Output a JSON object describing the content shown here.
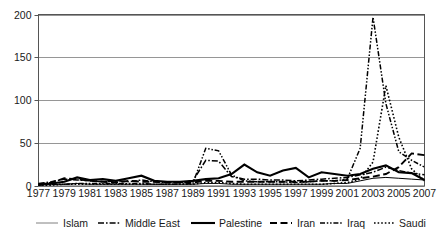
{
  "chart_data": {
    "type": "line",
    "title": "",
    "xlabel": "",
    "ylabel": "",
    "xlim": [
      1977,
      2007
    ],
    "ylim": [
      0,
      200
    ],
    "yticks": [
      0,
      50,
      100,
      150,
      200
    ],
    "ytick_labels": [
      "0",
      "50",
      "100",
      "150",
      "200"
    ],
    "grid": true,
    "legend_position": "bottom",
    "x": [
      1977,
      1978,
      1979,
      1980,
      1981,
      1982,
      1983,
      1984,
      1985,
      1986,
      1987,
      1988,
      1989,
      1990,
      1991,
      1992,
      1993,
      1994,
      1995,
      1996,
      1997,
      1998,
      1999,
      2000,
      2001,
      2002,
      2003,
      2004,
      2005,
      2006,
      2007
    ],
    "xtick_labels": [
      "1977",
      "1979",
      "1981",
      "1983",
      "1985",
      "1987",
      "1989",
      "1991",
      "1993",
      "1995",
      "1997",
      "1999",
      "2001",
      "2003",
      "2005",
      "2007"
    ],
    "series": [
      {
        "name": "Islam",
        "style": "thin-solid",
        "color": "#808080",
        "values": [
          1,
          2,
          2,
          3,
          2,
          2,
          2,
          2,
          2,
          2,
          2,
          2,
          2,
          3,
          3,
          2,
          2,
          2,
          2,
          2,
          2,
          2,
          2,
          3,
          3,
          6,
          9,
          10,
          9,
          8,
          7
        ]
      },
      {
        "name": "Middle East",
        "style": "dash-dot",
        "color": "#000000",
        "values": [
          3,
          5,
          8,
          7,
          6,
          5,
          6,
          5,
          7,
          5,
          4,
          4,
          6,
          30,
          29,
          11,
          8,
          8,
          7,
          7,
          6,
          7,
          8,
          9,
          10,
          13,
          16,
          22,
          18,
          15,
          13
        ]
      },
      {
        "name": "Palestine",
        "style": "thick-solid",
        "color": "#000000",
        "values": [
          2,
          3,
          5,
          10,
          7,
          8,
          6,
          9,
          12,
          6,
          5,
          5,
          6,
          8,
          9,
          14,
          25,
          16,
          12,
          18,
          21,
          10,
          16,
          14,
          12,
          14,
          20,
          24,
          16,
          15,
          7
        ]
      },
      {
        "name": "Iran",
        "style": "long-dash",
        "color": "#000000",
        "values": [
          2,
          4,
          9,
          8,
          6,
          5,
          4,
          6,
          5,
          5,
          4,
          4,
          4,
          6,
          6,
          5,
          5,
          5,
          5,
          5,
          5,
          5,
          6,
          6,
          7,
          9,
          11,
          14,
          22,
          38,
          36
        ]
      },
      {
        "name": "Iraq",
        "style": "dash-dot-dot",
        "color": "#000000",
        "values": [
          1,
          2,
          2,
          3,
          3,
          3,
          3,
          3,
          3,
          2,
          2,
          2,
          3,
          44,
          41,
          13,
          6,
          5,
          5,
          5,
          4,
          5,
          6,
          6,
          8,
          44,
          197,
          96,
          40,
          30,
          22
        ]
      },
      {
        "name": "Saudi",
        "style": "dotted",
        "color": "#000000",
        "values": [
          1,
          1,
          2,
          2,
          2,
          2,
          2,
          2,
          2,
          2,
          2,
          2,
          2,
          4,
          4,
          3,
          2,
          2,
          2,
          2,
          2,
          2,
          2,
          3,
          4,
          8,
          28,
          117,
          57,
          20,
          6
        ]
      }
    ]
  },
  "legend": {
    "items": [
      {
        "label": "Islam",
        "style": "thin-solid"
      },
      {
        "label": "Middle East",
        "style": "dash-dot"
      },
      {
        "label": "Palestine",
        "style": "thick-solid"
      },
      {
        "label": "Iran",
        "style": "long-dash"
      },
      {
        "label": "Iraq",
        "style": "dash-dot-dot"
      },
      {
        "label": "Saudi",
        "style": "dotted"
      }
    ]
  }
}
